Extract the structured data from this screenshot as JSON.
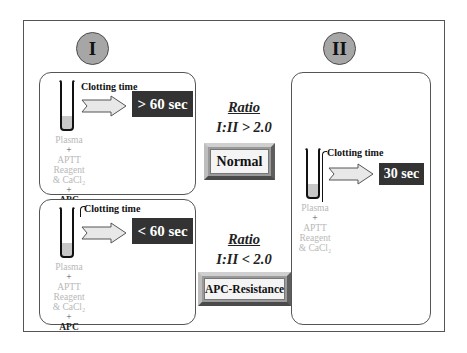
{
  "diagram": {
    "panel_I": {
      "label": "I",
      "normal_case": {
        "clotting_label": "Clotting time",
        "result": "> 60 sec",
        "reagents": [
          "Plasma",
          "+",
          "APTT",
          "Reagent",
          "& CaCl₂",
          "+",
          "APC"
        ]
      },
      "resistant_case": {
        "clotting_label": "Clotting time",
        "result": "< 60 sec",
        "reagents": [
          "Plasma",
          "+",
          "APTT",
          "Reagent",
          "& CaCl₂",
          "+",
          "APC"
        ]
      }
    },
    "panel_II": {
      "label": "II",
      "clotting_label": "Clotting time",
      "result": "30 sec",
      "reagents": [
        "Plasma",
        "+",
        "APTT",
        "Reagent",
        "& CaCl₂"
      ]
    },
    "ratio_normal": {
      "title": "Ratio",
      "expression": "I:II > 2.0",
      "outcome": "Normal"
    },
    "ratio_resistant": {
      "title": "Ratio",
      "expression": "I:II < 2.0",
      "outcome": "APC-Resistance"
    },
    "colors": {
      "circle_fill": "#a6a6a6",
      "timebox_fill": "#333333",
      "plasma_fill": "#c8c8c8",
      "arrow_fill": "#e8e8e8",
      "reagent_text": "#b8b8b8"
    }
  }
}
